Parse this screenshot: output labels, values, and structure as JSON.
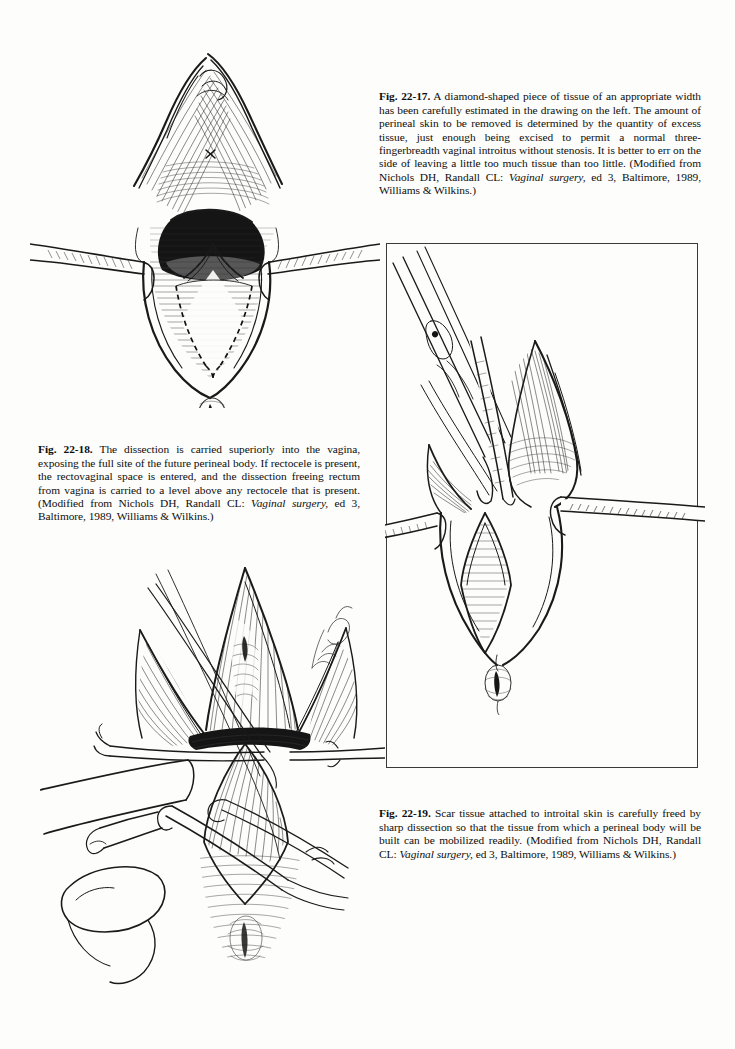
{
  "page": {
    "kind": "textbook-page",
    "background_color": "#fdfdfb",
    "ink_color": "#1a1a1a",
    "width": 735,
    "height": 1049
  },
  "figures": [
    {
      "id": "fig-22-17",
      "position": "top-left",
      "alt": "Pen and ink surgical drawing of a vaginal introitus held open by two lateral retractor blades; a diamond-shaped area of perineal skin is outlined with a dashed V-shaped incision line; a small X marks the urethral region; the anus is shown below.",
      "artist_signature": ""
    },
    {
      "id": "fig-22-18",
      "position": "middle-right",
      "framed": true,
      "alt": "Pen and ink surgical drawing inside a thin rectangular frame showing scissors and a retractor dissecting superiorly into the vagina, exposing the future perineal body site; lateral retractor blades extend to both sides beyond the frame.",
      "artist_signature": ""
    },
    {
      "id": "fig-22-19",
      "position": "bottom-left",
      "alt": "Pen and ink surgical drawing of a gloved hand with a finger in the rectum while forceps and scissors free scar tissue attached to introital skin by sharp dissection.",
      "artist_signature": "des Rist"
    }
  ],
  "captions": {
    "fig_22_17": {
      "label": "Fig. 22-17.",
      "body_1": " A diamond-shaped piece of tissue of an appropriate width has been carefully estimated in the drawing on the left. The amount of perineal skin to be removed is determined by the quantity of excess tissue, just enough being excised to permit a normal three-fingerbreadth vaginal introitus without stenosis. It is better to err on the side of leaving a little too much tissue than too little. (Modified from Nichols DH, Randall CL: ",
      "italic_1": "Vaginal surgery,",
      "body_2": " ed 3, Baltimore, 1989, Williams & Wilkins.)"
    },
    "fig_22_18": {
      "label": "Fig. 22-18.",
      "body_1": " The dissection is carried superiorly into the vagina, exposing the full site of the future perineal body. If rectocele is present, the rectovaginal space is entered, and the dissection freeing rectum from vagina is carried to a level above any rectocele that is present. (Modified from Nichols DH, Randall CL: ",
      "italic_1": "Vaginal surgery,",
      "body_2": " ed 3, Baltimore, 1989, Williams & Wilkins.)"
    },
    "fig_22_19": {
      "label": "Fig. 22-19.",
      "body_1": " Scar tissue attached to introital skin is carefully freed by sharp dissection so that the tissue from which a perineal body will be built can be mobilized readily. (Modified from Nichols DH, Randall CL: ",
      "italic_1": "Vaginal surgery,",
      "body_2": " ed 3, Baltimore, 1989, Williams & Wilkins.)"
    }
  }
}
